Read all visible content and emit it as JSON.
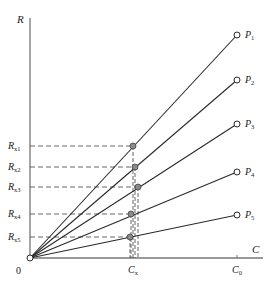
{
  "figure": {
    "y_axis_label": "R",
    "x_axis_label": "C",
    "origin_label": "0",
    "x_ticks": [
      {
        "label_main": "C",
        "label_sub": "x",
        "x": 133
      },
      {
        "label_main": "C",
        "label_sub": "0",
        "x": 237
      }
    ],
    "lines": [
      {
        "label_main": "P",
        "label_sub": "1",
        "end": [
          237,
          35
        ]
      },
      {
        "label_main": "P",
        "label_sub": "2",
        "end": [
          237,
          80
        ]
      },
      {
        "label_main": "P",
        "label_sub": "3",
        "end": [
          237,
          124
        ]
      },
      {
        "label_main": "P",
        "label_sub": "4",
        "end": [
          237,
          172
        ]
      },
      {
        "label_main": "P",
        "label_sub": "5",
        "end": [
          237,
          215
        ]
      }
    ],
    "readings": [
      {
        "label_main": "R",
        "label_sub": "x1",
        "point": [
          133,
          146
        ]
      },
      {
        "label_main": "R",
        "label_sub": "x2",
        "point": [
          135,
          167
        ]
      },
      {
        "label_main": "R",
        "label_sub": "x3",
        "point": [
          138,
          187
        ]
      },
      {
        "label_main": "R",
        "label_sub": "x4",
        "point": [
          131,
          214
        ]
      },
      {
        "label_main": "R",
        "label_sub": "x5",
        "point": [
          130,
          237
        ]
      }
    ],
    "colors": {
      "axis": "#777777",
      "line": "#2a2a2a",
      "dash": "#555555",
      "point_fill": "#8a8a8a",
      "end_marker_fill": "#ffffff"
    }
  }
}
